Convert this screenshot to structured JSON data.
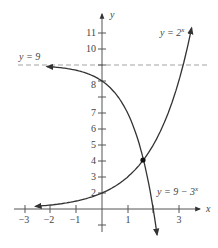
{
  "chart_data": {
    "type": "line",
    "title": "",
    "xlabel": "x",
    "ylabel": "y",
    "xlim": [
      -3.2,
      3.8
    ],
    "ylim": [
      -1.9,
      12
    ],
    "grid": false,
    "x_ticks": [
      -3,
      -2,
      -1,
      1,
      3
    ],
    "x_tick_labels": [
      "−3",
      "−2",
      "−1",
      "1",
      "3"
    ],
    "x_minor_ticks": [
      2
    ],
    "y_ticks": [
      -1,
      1,
      2,
      3,
      4,
      5,
      6,
      7,
      8,
      9,
      10,
      11
    ],
    "y_tick_labels": [
      "2",
      "3",
      "4",
      "5",
      "6",
      "7",
      "8",
      "10",
      "11"
    ],
    "y_labeled_values": [
      2,
      3,
      4,
      5,
      6,
      7,
      8,
      10,
      11
    ],
    "series": [
      {
        "name": "y = 2^x",
        "label": "y = 2",
        "label_sup": "x",
        "function": "2^x",
        "x_range": [
          -2.6,
          3.5
        ],
        "arrows": "both",
        "color": "#333333"
      },
      {
        "name": "y = 9 − 3^x",
        "label": "y = 9 − 3",
        "label_sup": "x",
        "function": "9 - 3^x",
        "x_range": [
          -2.15,
          2.15
        ],
        "arrows": "both",
        "color": "#333333"
      }
    ],
    "asymptote": {
      "label": "y = 9",
      "y": 9,
      "style": "dashed",
      "color": "#999999"
    },
    "intersection_point": {
      "x": 1.58,
      "y": 3.0
    },
    "legend": "inline labels"
  },
  "labels": {
    "x_axis": "x",
    "y_axis": "y",
    "curve1": "y = 2",
    "curve1_sup": "x",
    "curve2": "y = 9 − 3",
    "curve2_sup": "x",
    "asymptote": "y = 9",
    "xt": [
      "−3",
      "−2",
      "−1",
      "1",
      "3"
    ],
    "yt": {
      "2": "2",
      "3": "3",
      "4": "4",
      "5": "5",
      "6": "6",
      "7": "7",
      "8": "8",
      "10": "10",
      "11": "11"
    }
  }
}
